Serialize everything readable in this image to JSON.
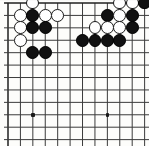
{
  "board": {
    "kind": "go-board",
    "title": "Go board position",
    "size": 19,
    "origin_x": 8,
    "origin_y": 3,
    "spacing": 12.42,
    "stone_radius": 6.4,
    "cols_visible": 12,
    "rows_visible": 12,
    "line_color": "#3b3b3b",
    "edge_color": "#1f1f1f",
    "board_color": "#fdfdfb",
    "black_color": "#111111",
    "white_color": "#ffffff",
    "star_points": [
      {
        "col": 2,
        "row": 9
      },
      {
        "col": 8,
        "row": 9
      }
    ],
    "stones": [
      {
        "col": 2,
        "row": 0,
        "color": "white"
      },
      {
        "col": 1,
        "row": 1,
        "color": "white"
      },
      {
        "col": 2,
        "row": 1,
        "color": "black"
      },
      {
        "col": 3,
        "row": 1,
        "color": "white"
      },
      {
        "col": 4,
        "row": 1,
        "color": "white"
      },
      {
        "col": 1,
        "row": 2,
        "color": "white"
      },
      {
        "col": 2,
        "row": 2,
        "color": "black"
      },
      {
        "col": 3,
        "row": 2,
        "color": "black"
      },
      {
        "col": 1,
        "row": 3,
        "color": "white"
      },
      {
        "col": 2,
        "row": 4,
        "color": "black"
      },
      {
        "col": 3,
        "row": 4,
        "color": "black"
      },
      {
        "col": 9,
        "row": 0,
        "color": "white"
      },
      {
        "col": 10,
        "row": 0,
        "color": "white"
      },
      {
        "col": 11,
        "row": 0,
        "color": "black"
      },
      {
        "col": 8,
        "row": 1,
        "color": "black"
      },
      {
        "col": 9,
        "row": 1,
        "color": "white"
      },
      {
        "col": 10,
        "row": 1,
        "color": "black"
      },
      {
        "col": 12,
        "row": 1,
        "color": "black"
      },
      {
        "col": 7,
        "row": 2,
        "color": "white"
      },
      {
        "col": 8,
        "row": 2,
        "color": "white"
      },
      {
        "col": 9,
        "row": 2,
        "color": "white"
      },
      {
        "col": 10,
        "row": 2,
        "color": "black"
      },
      {
        "col": 6,
        "row": 3,
        "color": "black"
      },
      {
        "col": 7,
        "row": 3,
        "color": "black"
      },
      {
        "col": 8,
        "row": 3,
        "color": "black"
      },
      {
        "col": 9,
        "row": 3,
        "color": "black"
      }
    ]
  }
}
